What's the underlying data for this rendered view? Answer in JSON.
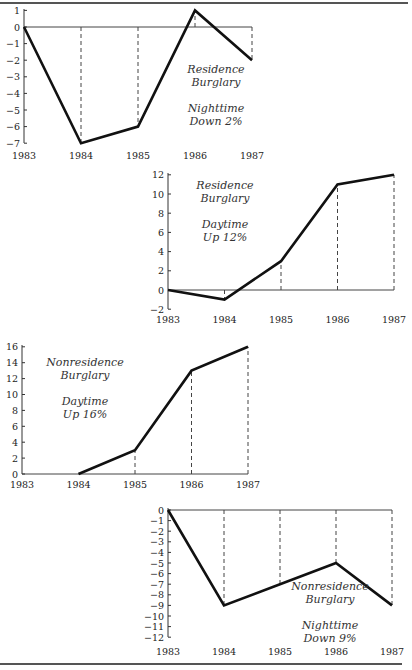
{
  "chart_data": [
    {
      "type": "line",
      "title": "Residence Burglary",
      "subtitle": "Nighttime Down 2%",
      "annotation_lines": [
        "Residence",
        "Burglary",
        "",
        "Nighttime",
        "Down 2%"
      ],
      "categories": [
        "1983",
        "1984",
        "1985",
        "1986",
        "1987"
      ],
      "values": [
        0,
        -7,
        -6,
        1,
        -2
      ],
      "yticks": [
        1,
        0,
        -1,
        -2,
        -3,
        -4,
        -5,
        -6,
        -7
      ],
      "ylim": [
        -7,
        1
      ],
      "xlabel": "",
      "ylabel": "",
      "grid": false,
      "drop_lines": "dashed vertical lines from each point to zero line"
    },
    {
      "type": "line",
      "title": "Residence Burglary",
      "subtitle": "Daytime Up 12%",
      "annotation_lines": [
        "Residence",
        "Burglary",
        "",
        "Daytime",
        "Up 12%"
      ],
      "categories": [
        "1983",
        "1984",
        "1985",
        "1986",
        "1987"
      ],
      "values": [
        0,
        -1,
        3,
        11,
        12
      ],
      "yticks": [
        12,
        10,
        8,
        6,
        4,
        2,
        0,
        -2
      ],
      "ylim": [
        -2,
        12
      ],
      "xlabel": "",
      "ylabel": "",
      "grid": false,
      "drop_lines": "dashed vertical lines from each point to zero line"
    },
    {
      "type": "line",
      "title": "Nonresidence Burglary",
      "subtitle": "Daytime Up 16%",
      "annotation_lines": [
        "Nonresidence",
        "Burglary",
        "",
        "Daytime",
        "Up 16%"
      ],
      "categories": [
        "1983",
        "1984",
        "1985",
        "1986",
        "1987"
      ],
      "values": [
        null,
        0,
        3,
        13,
        16
      ],
      "yticks": [
        16,
        14,
        12,
        10,
        8,
        6,
        4,
        2,
        0
      ],
      "ylim": [
        0,
        16
      ],
      "xlabel": "",
      "ylabel": "",
      "grid": false,
      "drop_lines": "dashed vertical lines from each point to zero line"
    },
    {
      "type": "line",
      "title": "Nonresidence Burglary",
      "subtitle": "Nighttime Down 9%",
      "annotation_lines": [
        "Nonresidence",
        "Burglary",
        "",
        "Nighttime",
        "Down 9%"
      ],
      "categories": [
        "1983",
        "1984",
        "1985",
        "1986",
        "1987"
      ],
      "values": [
        0,
        -9,
        -7,
        -5,
        -9
      ],
      "yticks": [
        0,
        -1,
        -2,
        -3,
        -4,
        -5,
        -6,
        -7,
        -8,
        -9,
        -10,
        -11,
        -12
      ],
      "ylim": [
        -12,
        0
      ],
      "xlabel": "",
      "ylabel": "",
      "grid": false,
      "drop_lines": "dashed vertical lines from each point to zero line"
    }
  ],
  "layout": [
    {
      "x0": 24,
      "dx": 57,
      "y0": 27,
      "ppu": 16.6,
      "ytop": 11,
      "ybottom": 143,
      "xlabel_y": 159,
      "annot_x": 216,
      "annot_y": 73,
      "annot_lh": 13
    },
    {
      "x0": 168,
      "dx": 56.5,
      "y0": 290,
      "ppu": 9.6,
      "ytop": 175,
      "ybottom": 309,
      "xlabel_y": 323,
      "annot_x": 225,
      "annot_y": 189,
      "annot_lh": 13
    },
    {
      "x0": 22,
      "dx": 56.5,
      "y0": 474,
      "ppu": 7.95,
      "ytop": 347,
      "ybottom": 474,
      "xlabel_y": 488,
      "annot_x": 85,
      "annot_y": 366,
      "annot_lh": 13
    },
    {
      "x0": 168,
      "dx": 56,
      "y0": 510,
      "ppu": 10.6,
      "ytop": 510,
      "ybottom": 637,
      "xlabel_y": 655,
      "annot_x": 330,
      "annot_y": 590,
      "annot_lh": 13
    }
  ],
  "rules": {
    "top_y": 2,
    "top_width": 408,
    "bottom_y": 663,
    "bottom_width": 402
  }
}
